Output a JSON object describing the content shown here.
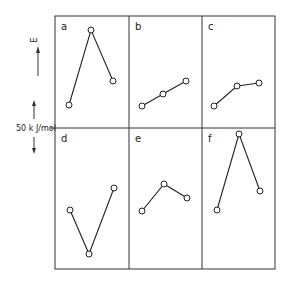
{
  "figure": {
    "y_axis": {
      "symbol": "E",
      "scale_label": "50 k J/mol",
      "direction": "up"
    },
    "panels": [
      {
        "id": "a",
        "label": "a",
        "points": [
          [
            69,
            105
          ],
          [
            91,
            30
          ],
          [
            113,
            81
          ]
        ]
      },
      {
        "id": "b",
        "label": "b",
        "points": [
          [
            142,
            106
          ],
          [
            163,
            94
          ],
          [
            186,
            81
          ]
        ]
      },
      {
        "id": "c",
        "label": "c",
        "points": [
          [
            214,
            106
          ],
          [
            237,
            86
          ],
          [
            259,
            83
          ]
        ]
      },
      {
        "id": "d",
        "label": "d",
        "points": [
          [
            70,
            210
          ],
          [
            89,
            254
          ],
          [
            114,
            188
          ]
        ]
      },
      {
        "id": "e",
        "label": "e",
        "points": [
          [
            142,
            211
          ],
          [
            164,
            184
          ],
          [
            187,
            198
          ]
        ]
      },
      {
        "id": "f",
        "label": "f",
        "points": [
          [
            217,
            210
          ],
          [
            239,
            134
          ],
          [
            260,
            191
          ]
        ]
      }
    ],
    "colors": {
      "line": "#222222",
      "frame": "#333333",
      "marker_fill": "#ffffff"
    }
  }
}
